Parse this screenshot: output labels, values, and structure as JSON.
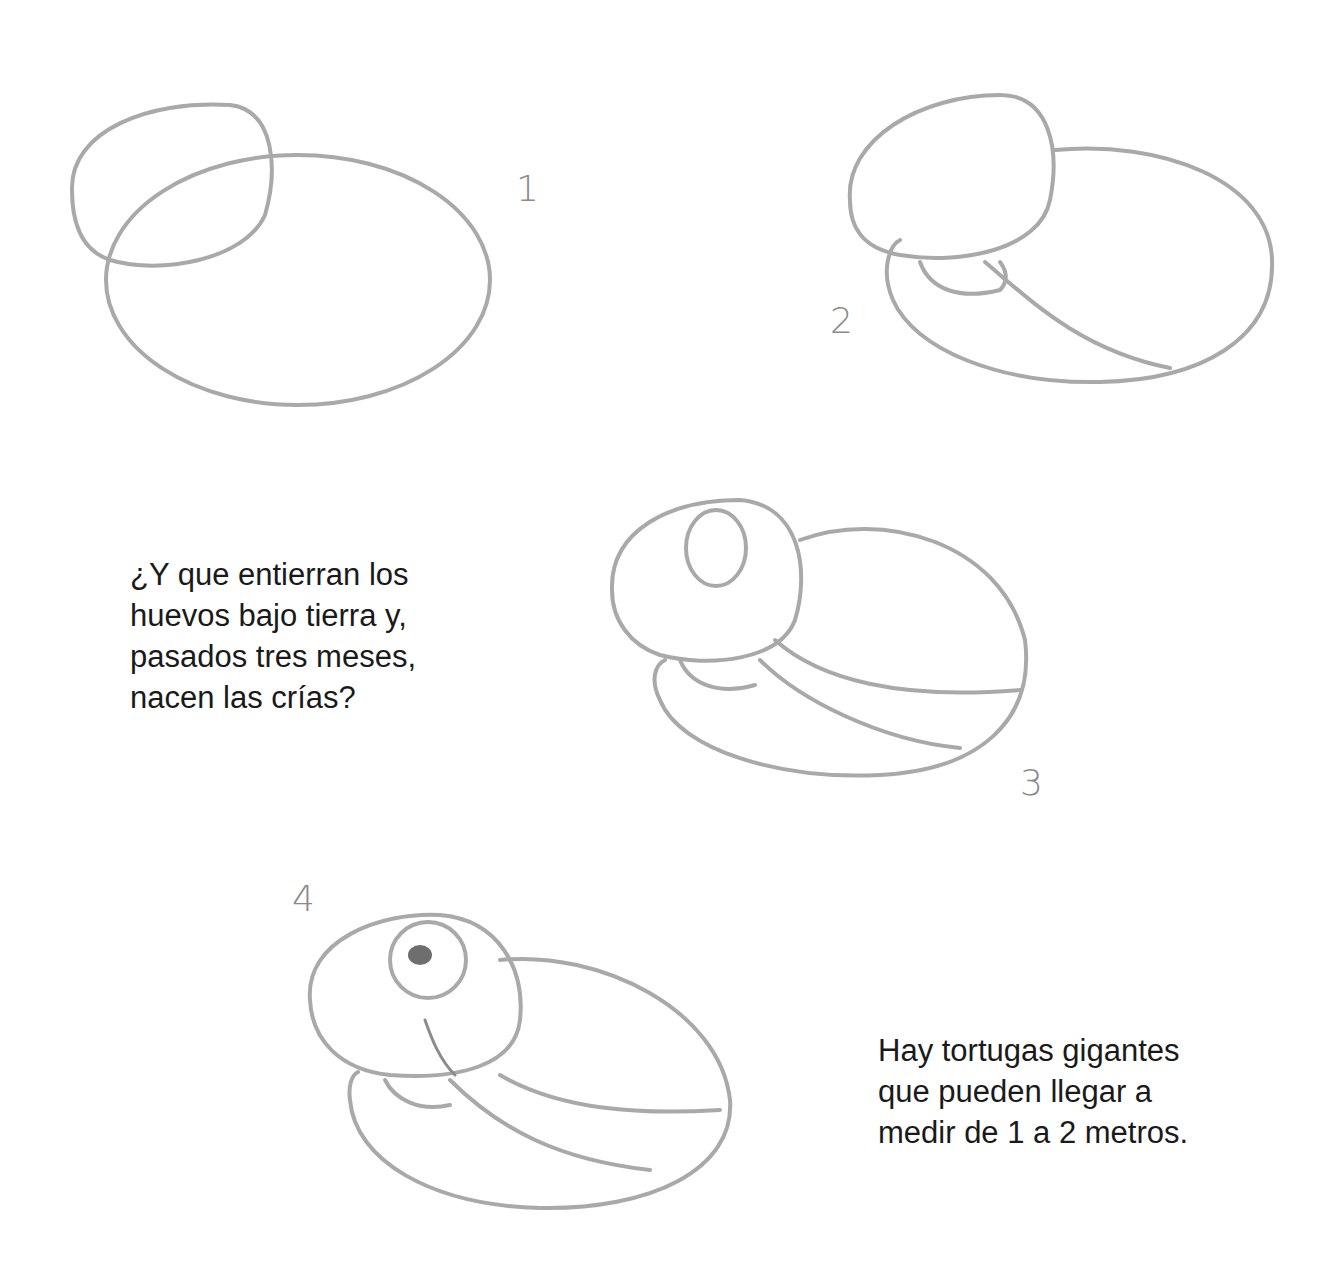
{
  "steps": [
    {
      "number": "1"
    },
    {
      "number": "2"
    },
    {
      "number": "3"
    },
    {
      "number": "4"
    }
  ],
  "captions": {
    "eggs_text": "¿Y que entierran los\nhuevos bajo tierra y,\npasados tres meses,\nnacen las crías?",
    "giant_text": "Hay tortugas gigantes\nque pueden llegar a\nmedir de 1 a 2 metros."
  },
  "colors": {
    "pencil": "#a9a9a9",
    "text": "#1a1a1a",
    "background": "#ffffff"
  }
}
